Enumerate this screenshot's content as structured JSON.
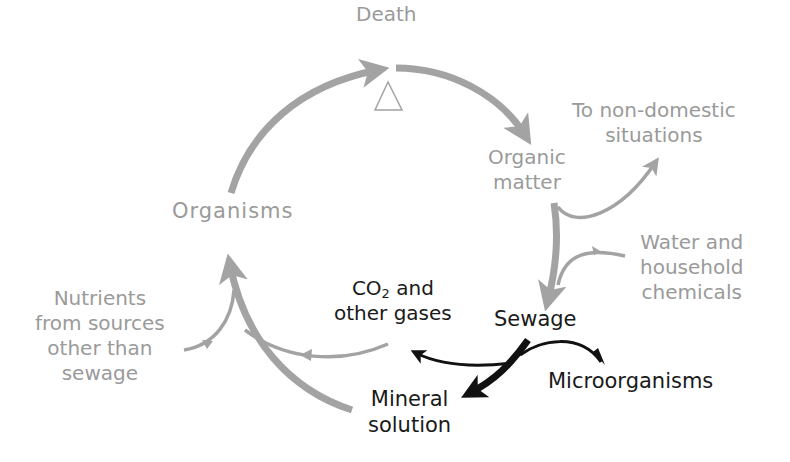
{
  "colors": {
    "cycle_gray": "#a3a3a3",
    "label_gray": "#9a9a9a",
    "sewage_black": "#111111",
    "background": "#ffffff"
  },
  "nodes": {
    "death": {
      "label": "Death"
    },
    "organic_matter": {
      "line1": "Organic",
      "line2": "matter"
    },
    "to_non_domestic": {
      "line1": "To non-domestic",
      "line2": "situations"
    },
    "water_household": {
      "line1": "Water and",
      "line2": "household",
      "line3": "chemicals"
    },
    "organisms": {
      "label": "Organisms"
    },
    "nutrients_other": {
      "line1": "Nutrients",
      "line2": "from sources",
      "line3": "other than",
      "line4": "sewage"
    },
    "co2_gases": {
      "line1_main": "CO",
      "line1_sub": "2",
      "line1_rest": " and",
      "line2": "other gases"
    },
    "sewage": {
      "label": "Sewage"
    },
    "mineral_solution": {
      "line1": "Mineral",
      "line2": "solution"
    },
    "microorganisms": {
      "label": "Microorganisms"
    }
  },
  "edges": [
    {
      "from": "Organisms",
      "to": "Death",
      "color": "gray"
    },
    {
      "from": "Death",
      "to": "Organic matter",
      "color": "gray"
    },
    {
      "from": "Organic matter",
      "to": "To non-domestic situations",
      "color": "gray"
    },
    {
      "from": "Water and household chemicals",
      "to": "Sewage",
      "color": "gray"
    },
    {
      "from": "Organic matter",
      "to": "Sewage",
      "color": "gray"
    },
    {
      "from": "Sewage",
      "to": "CO2 and other gases",
      "color": "black"
    },
    {
      "from": "Sewage",
      "to": "Mineral solution",
      "color": "black"
    },
    {
      "from": "Microorganisms",
      "to": "Sewage",
      "color": "black"
    },
    {
      "from": "CO2 and other gases",
      "to": "Organisms",
      "color": "gray"
    },
    {
      "from": "Mineral solution",
      "to": "Organisms",
      "color": "gray"
    },
    {
      "from": "Nutrients from sources other than sewage",
      "to": "Organisms",
      "color": "gray"
    }
  ],
  "symbols": {
    "death_marker": "triangle"
  }
}
